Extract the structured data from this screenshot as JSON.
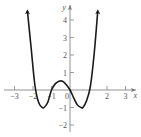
{
  "chart_data": {
    "type": "line",
    "title": "",
    "xlabel": "x",
    "ylabel": "y",
    "xlim": [
      -3.5,
      3.7
    ],
    "ylim": [
      -2.4,
      4.6
    ],
    "x_ticks": [
      -3,
      -2,
      -1,
      0,
      2,
      3
    ],
    "x_tick_labels": [
      "−3",
      "−2",
      "−1",
      "0",
      "2",
      "3"
    ],
    "y_ticks": [
      -2,
      -1,
      1,
      2,
      3,
      4
    ],
    "y_tick_labels": [
      "−2",
      "−1",
      "1",
      "2",
      "3",
      "4"
    ],
    "grid": false,
    "series": [
      {
        "name": "f(x)",
        "x": [
          -2.3,
          -2.1,
          -1.9,
          -1.7,
          -1.5,
          -1.4,
          -1.2,
          -1.0,
          -0.8,
          -0.6,
          -0.4,
          -0.2,
          0.0,
          0.2,
          0.4,
          0.6,
          0.7,
          0.9,
          1.1,
          1.3,
          1.5
        ],
        "values": [
          4.5,
          2.4,
          0.3,
          -0.7,
          -1.0,
          -1.0,
          -0.7,
          0.0,
          0.35,
          0.5,
          0.5,
          0.3,
          0.0,
          -0.45,
          -0.85,
          -1.0,
          -1.0,
          -0.6,
          0.2,
          2.0,
          4.5
        ]
      }
    ]
  },
  "axes": {
    "x_label": "x",
    "y_label": "y"
  },
  "colors": {
    "curve": "#1a1a1a",
    "axis": "#777777",
    "text": "#555555"
  }
}
